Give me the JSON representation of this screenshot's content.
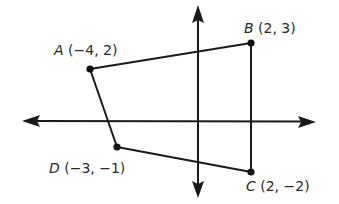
{
  "diagram": {
    "type": "quadrilateral on coordinate plane",
    "axes": {
      "x_axis": "horizontal double-arrow",
      "y_axis": "vertical double-arrow"
    },
    "points": [
      {
        "name": "A",
        "coords": "(−4, 2)",
        "x": -4,
        "y": 2
      },
      {
        "name": "B",
        "coords": "(2, 3)",
        "x": 2,
        "y": 3
      },
      {
        "name": "C",
        "coords": "(2, −2)",
        "x": 2,
        "y": -2
      },
      {
        "name": "D",
        "coords": "(−3, −1)",
        "x": -3,
        "y": -1
      }
    ],
    "edges": [
      "AB",
      "BC",
      "CD",
      "DA"
    ],
    "colors": {
      "line": "#1a1a1a",
      "background": "#ffffff"
    }
  }
}
